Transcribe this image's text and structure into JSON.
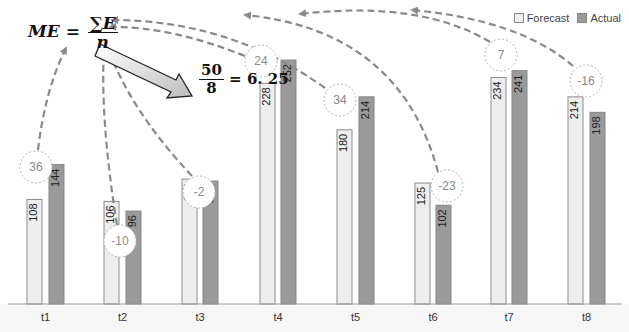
{
  "chart_data": {
    "type": "bar",
    "title": "",
    "xlabel": "",
    "ylabel": "",
    "categories": [
      "t1",
      "t2",
      "t3",
      "t4",
      "t5",
      "t6",
      "t7",
      "t8"
    ],
    "series": [
      {
        "name": "Forecast",
        "color": "#e8e8e8",
        "values": [
          108,
          106,
          129,
          228,
          180,
          125,
          234,
          214
        ]
      },
      {
        "name": "Actual",
        "color": "#9a9a9a",
        "values": [
          144,
          96,
          127,
          252,
          214,
          102,
          241,
          198
        ]
      }
    ],
    "errors": [
      36,
      -10,
      -2,
      24,
      34,
      -23,
      7,
      -16
    ],
    "ylim": [
      0,
      260
    ],
    "grid": false,
    "legend_position": "top-right",
    "annotations": {
      "formula": "ME = ΣE / n",
      "computation": "50 / 8 = 6.25",
      "sum_of_errors": 50,
      "n": 8,
      "mean_error": 6.25
    }
  },
  "legend": {
    "forecast": "Forecast",
    "actual": "Actual"
  },
  "formula": {
    "lhs": "ME =",
    "numerator": "∑E",
    "denominator": "n"
  },
  "result": {
    "numerator": "50",
    "denominator": "8",
    "value": "= 6. 25"
  }
}
